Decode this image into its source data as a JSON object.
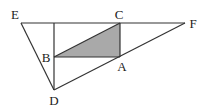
{
  "diagram": {
    "type": "geometry",
    "colors": {
      "line": "#333333",
      "shade": "#a9a9a9",
      "label": "#222222",
      "background": "#ffffff"
    },
    "points": {
      "E": {
        "x": 21,
        "y": 23,
        "label": "E",
        "label_x": 15,
        "label_y": 14
      },
      "C": {
        "x": 120,
        "y": 23,
        "label": "C",
        "label_x": 119,
        "label_y": 14
      },
      "F": {
        "x": 185,
        "y": 23,
        "label": "F",
        "label_x": 193,
        "label_y": 23
      },
      "B": {
        "x": 54,
        "y": 57,
        "label": "B",
        "label_x": 46,
        "label_y": 57
      },
      "A": {
        "x": 120,
        "y": 57,
        "label": "A",
        "label_x": 122,
        "label_y": 66
      },
      "D": {
        "x": 54,
        "y": 90,
        "label": "D",
        "label_x": 54,
        "label_y": 100
      },
      "T": {
        "x": 54,
        "y": 23
      }
    },
    "segments": [
      [
        "E",
        "F"
      ],
      [
        "E",
        "D"
      ],
      [
        "D",
        "F"
      ],
      [
        "T",
        "D"
      ],
      [
        "B",
        "A"
      ],
      [
        "C",
        "A"
      ],
      [
        "B",
        "C"
      ]
    ],
    "shaded_triangle": [
      "B",
      "C",
      "A"
    ]
  }
}
